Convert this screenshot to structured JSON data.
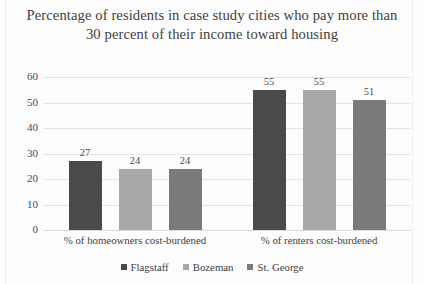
{
  "chart_data": {
    "type": "bar",
    "title": "Percentage of residents in case study cities who pay more than 30 percent of their income toward housing",
    "xlabel": "",
    "ylabel": "",
    "ylim": [
      0,
      60
    ],
    "yticks": [
      0,
      10,
      20,
      30,
      40,
      50,
      60
    ],
    "grid": true,
    "legend_position": "bottom",
    "categories": [
      "% of homeowners cost-burdened",
      "% of renters cost-burdened"
    ],
    "series": [
      {
        "name": "Flagstaff",
        "color": "#4a4a4a",
        "values": [
          27,
          55
        ]
      },
      {
        "name": "Bozeman",
        "color": "#a8a8a8",
        "values": [
          24,
          55
        ]
      },
      {
        "name": "St. George",
        "color": "#7a7a7a",
        "values": [
          24,
          51
        ]
      }
    ]
  }
}
